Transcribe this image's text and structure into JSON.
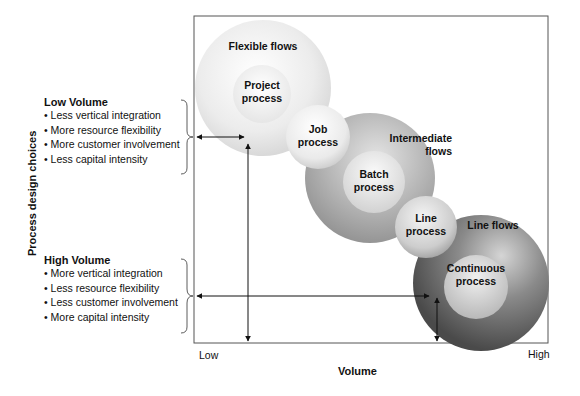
{
  "axes": {
    "y_label": "Process design choices",
    "x_label": "Volume",
    "x_low": "Low",
    "x_high": "High"
  },
  "low_volume": {
    "title": "Low Volume",
    "bullets": [
      "Less vertical integration",
      "More resource flexibility",
      "More customer involvement",
      "Less capital intensity"
    ]
  },
  "high_volume": {
    "title": "High Volume",
    "bullets": [
      "More vertical integration",
      "Less resource flexibility",
      "Less customer involvement",
      "More capital intensity"
    ]
  },
  "circles": {
    "flexible_flows": "Flexible flows",
    "project_process": [
      "Project",
      "process"
    ],
    "job_process": [
      "Job",
      "process"
    ],
    "intermediate_flows": [
      "Intermediate",
      "flows"
    ],
    "batch_process": [
      "Batch",
      "process"
    ],
    "line_process": [
      "Line",
      "process"
    ],
    "line_flows": "Line flows",
    "continuous_process": [
      "Continuous",
      "process"
    ]
  },
  "colors": {
    "frame": "#555555",
    "flexible_fill": "#e6e6e6",
    "intermediate_fill": "#a9a9a9",
    "line_flows_fill": "#6e6e6e",
    "inner_light": "#f2f2f2"
  }
}
